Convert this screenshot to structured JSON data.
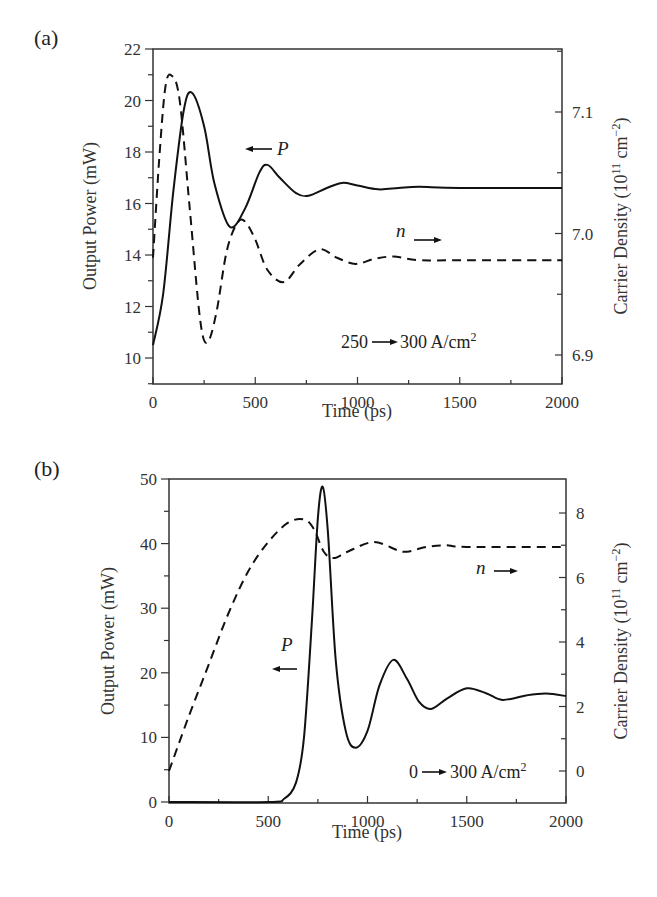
{
  "figure": {
    "panel_a": {
      "label": "(a)",
      "xlabel": "Time (ps)",
      "ylabel_left": "Output Power (mW)",
      "ylabel_right_main": "Carrier Density (10",
      "ylabel_right_sup1": "11",
      "ylabel_right_mid": " cm",
      "ylabel_right_sup2": "−2",
      "ylabel_right_end": ")",
      "x_ticks": [
        "0",
        "500",
        "1000",
        "1500",
        "2000"
      ],
      "y_left_ticks": [
        "10",
        "12",
        "14",
        "16",
        "18",
        "20",
        "22"
      ],
      "y_right_ticks": [
        "6.9",
        "7.0",
        "7.1"
      ],
      "annotation_P": "P",
      "annotation_n": "n",
      "annotation_current_from": "250",
      "annotation_current_to": "300 A/cm",
      "annotation_current_sup": "2"
    },
    "panel_b": {
      "label": "(b)",
      "xlabel": "Time (ps)",
      "ylabel_left": "Output Power (mW)",
      "ylabel_right_main": "Carrier Density (10",
      "ylabel_right_sup1": "11",
      "ylabel_right_mid": " cm",
      "ylabel_right_sup2": "−2",
      "ylabel_right_end": ")",
      "x_ticks": [
        "0",
        "500",
        "1000",
        "1500",
        "2000"
      ],
      "y_left_ticks": [
        "0",
        "10",
        "20",
        "30",
        "40",
        "50"
      ],
      "y_right_ticks": [
        "0",
        "2",
        "4",
        "6",
        "8"
      ],
      "annotation_P": "P",
      "annotation_n": "n",
      "annotation_current_from": "0",
      "annotation_current_to": "300 A/cm",
      "annotation_current_sup": "2"
    }
  },
  "chart_data": [
    {
      "type": "line",
      "title": "(a)",
      "xlabel": "Time (ps)",
      "ylabel": "Output Power (mW)",
      "ylabel_right": "Carrier Density (10^11 cm^-2)",
      "xlim": [
        0,
        2000
      ],
      "ylim": [
        9,
        22
      ],
      "ylim_right": [
        6.86,
        7.17
      ],
      "grid": false,
      "annotations": [
        "← P",
        "n →",
        "250 → 300 A/cm^2"
      ],
      "series": [
        {
          "name": "P (Output Power)",
          "axis": "left",
          "style": "solid",
          "x": [
            0,
            50,
            100,
            150,
            190,
            250,
            300,
            375,
            450,
            520,
            560,
            620,
            700,
            760,
            850,
            925,
            1000,
            1100,
            1200,
            1300,
            1500,
            2000
          ],
          "y": [
            10.5,
            12.5,
            16.5,
            19.6,
            20.3,
            19.0,
            16.8,
            15.1,
            15.8,
            17.2,
            17.5,
            17.0,
            16.4,
            16.3,
            16.6,
            16.8,
            16.7,
            16.55,
            16.6,
            16.65,
            16.6,
            16.6
          ]
        },
        {
          "name": "n (Carrier Density)",
          "axis": "right",
          "style": "dashed",
          "x": [
            0,
            30,
            60,
            90,
            130,
            180,
            230,
            265,
            310,
            360,
            410,
            450,
            500,
            560,
            640,
            720,
            815,
            900,
            990,
            1080,
            1175,
            1300,
            1500,
            2000
          ],
          "y": [
            6.98,
            7.06,
            7.12,
            7.13,
            7.11,
            7.02,
            6.93,
            6.91,
            6.935,
            6.985,
            7.008,
            7.01,
            6.995,
            6.97,
            6.96,
            6.975,
            6.987,
            6.98,
            6.975,
            6.979,
            6.981,
            6.978,
            6.978,
            6.978
          ]
        }
      ]
    },
    {
      "type": "line",
      "title": "(b)",
      "xlabel": "Time (ps)",
      "ylabel": "Output Power (mW)",
      "ylabel_right": "Carrier Density (10^11 cm^-2)",
      "xlim": [
        0,
        2000
      ],
      "ylim": [
        0,
        50
      ],
      "ylim_right": [
        -1,
        9
      ],
      "grid": false,
      "annotations": [
        "P ←",
        "n →",
        "0 → 300 A/cm^2"
      ],
      "series": [
        {
          "name": "P (Output Power)",
          "axis": "left",
          "style": "solid",
          "x": [
            0,
            500,
            580,
            640,
            680,
            720,
            750,
            775,
            800,
            840,
            890,
            940,
            1000,
            1060,
            1130,
            1200,
            1260,
            1320,
            1400,
            1500,
            1600,
            1680,
            1800,
            1900,
            2000
          ],
          "y": [
            0,
            0,
            0.5,
            3,
            10,
            28,
            44,
            48.8,
            42,
            22,
            11,
            8.4,
            11,
            18,
            22,
            19,
            15.5,
            14.4,
            16,
            17.6,
            16.8,
            15.8,
            16.5,
            16.8,
            16.4
          ]
        },
        {
          "name": "n (Carrier Density)",
          "axis": "right",
          "style": "dashed",
          "x": [
            0,
            100,
            200,
            300,
            400,
            500,
            600,
            680,
            730,
            780,
            830,
            900,
            1030,
            1150,
            1200,
            1300,
            1400,
            1500,
            2000
          ],
          "y": [
            0,
            1.7,
            3.3,
            4.9,
            6.2,
            7.1,
            7.7,
            7.8,
            7.5,
            6.8,
            6.6,
            6.8,
            7.1,
            6.85,
            6.8,
            6.95,
            7.0,
            6.95,
            6.95
          ]
        }
      ]
    }
  ]
}
